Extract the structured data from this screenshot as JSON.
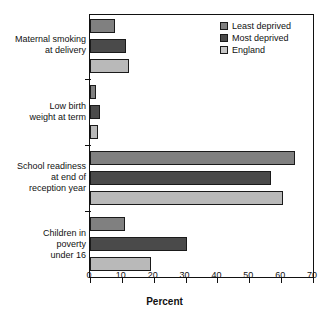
{
  "chart_data": {
    "type": "bar",
    "orientation": "horizontal",
    "title": "",
    "xlabel": "Percent",
    "ylabel": "",
    "xlim": [
      0,
      70
    ],
    "xticks": [
      0,
      10,
      20,
      30,
      40,
      50,
      60,
      70
    ],
    "grid": false,
    "legend_position": "top-right",
    "categories": [
      "Maternal smoking\nat delivery",
      "Low birth\nweight at term",
      "School readiness\nat end of\nreception year",
      "Children in\npoverty\nunder 16"
    ],
    "series": [
      {
        "name": "Least deprived",
        "color": "#808080",
        "values": [
          8.0,
          2.0,
          64.5,
          11.0
        ]
      },
      {
        "name": "Most deprived",
        "color": "#4a4a4a",
        "values": [
          11.3,
          3.2,
          56.8,
          30.5
        ]
      },
      {
        "name": "England",
        "color": "#b9b9b9",
        "values": [
          12.2,
          2.4,
          60.5,
          19.0
        ]
      }
    ]
  },
  "legend": {
    "items": [
      {
        "label": "Least deprived"
      },
      {
        "label": "Most deprived"
      },
      {
        "label": "England"
      }
    ]
  },
  "axis": {
    "title": "Percent",
    "ticks": [
      "0",
      "10",
      "20",
      "30",
      "40",
      "50",
      "60",
      "70"
    ]
  }
}
